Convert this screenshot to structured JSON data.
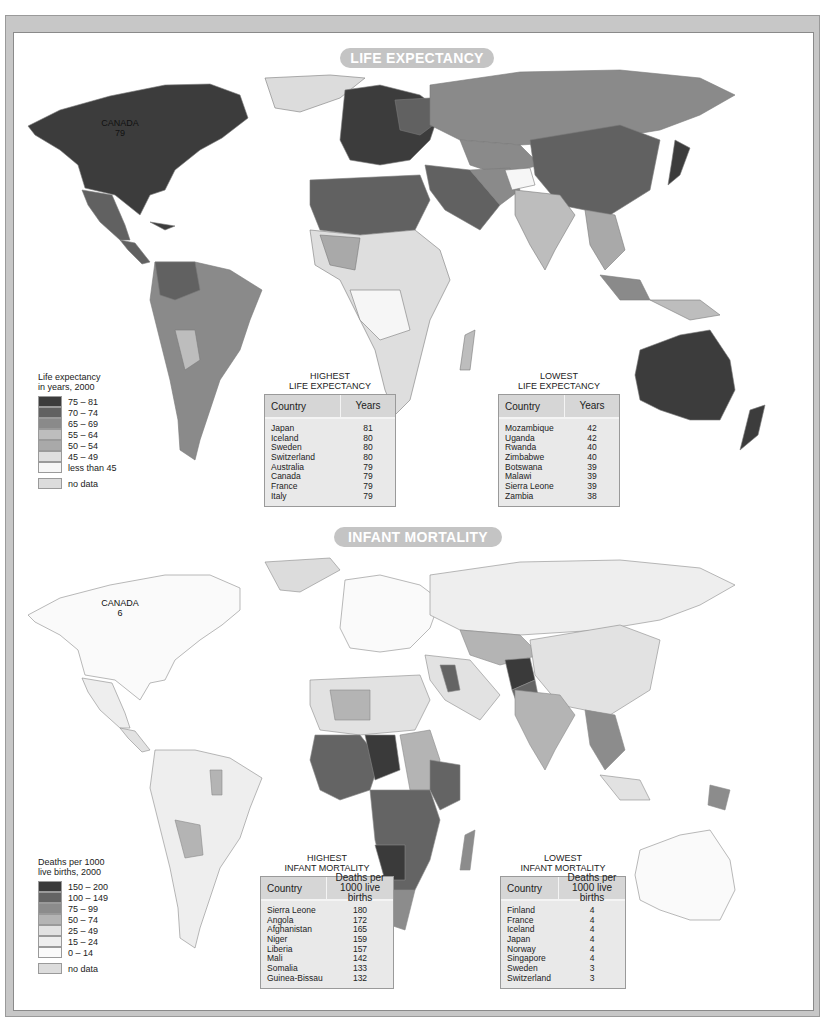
{
  "maps": [
    {
      "id": "life-expectancy",
      "title": "LIFE EXPECTANCY",
      "canada_label": {
        "name": "CANADA",
        "value": "79"
      },
      "legend": {
        "title_line1": "Life expectancy",
        "title_line2": "in years, 2000",
        "classes": [
          {
            "label": "75 – 81",
            "color": "#3c3c3c"
          },
          {
            "label": "70 – 74",
            "color": "#616161"
          },
          {
            "label": "65 – 69",
            "color": "#8a8a8a"
          },
          {
            "label": "55 – 64",
            "color": "#bdbdbd"
          },
          {
            "label": "50 – 54",
            "color": "#a9a9a9"
          },
          {
            "label": "45 – 49",
            "color": "#dedede"
          },
          {
            "label": "less than 45",
            "color": "#f6f6f6"
          }
        ],
        "no_data": {
          "label": "no data",
          "color": "#dcdcdc"
        }
      },
      "tables": [
        {
          "caption_line1": "HIGHEST",
          "caption_line2": "LIFE EXPECTANCY",
          "col1": "Country",
          "col2": "Years",
          "rows": [
            {
              "country": "Japan",
              "value": "81"
            },
            {
              "country": "Iceland",
              "value": "80"
            },
            {
              "country": "Sweden",
              "value": "80"
            },
            {
              "country": "Switzerland",
              "value": "80"
            },
            {
              "country": "Australia",
              "value": "79"
            },
            {
              "country": "Canada",
              "value": "79"
            },
            {
              "country": "France",
              "value": "79"
            },
            {
              "country": "Italy",
              "value": "79"
            }
          ]
        },
        {
          "caption_line1": "LOWEST",
          "caption_line2": "LIFE EXPECTANCY",
          "col1": "Country",
          "col2": "Years",
          "rows": [
            {
              "country": "Mozambique",
              "value": "42"
            },
            {
              "country": "Uganda",
              "value": "42"
            },
            {
              "country": "Rwanda",
              "value": "40"
            },
            {
              "country": "Zimbabwe",
              "value": "40"
            },
            {
              "country": "Botswana",
              "value": "39"
            },
            {
              "country": "Malawi",
              "value": "39"
            },
            {
              "country": "Sierra Leone",
              "value": "39"
            },
            {
              "country": "Zambia",
              "value": "38"
            }
          ]
        }
      ]
    },
    {
      "id": "infant-mortality",
      "title": "INFANT MORTALITY",
      "canada_label": {
        "name": "CANADA",
        "value": "6"
      },
      "legend": {
        "title_line1": "Deaths per 1000",
        "title_line2": "live births, 2000",
        "classes": [
          {
            "label": "150 – 200",
            "color": "#3a3a3a"
          },
          {
            "label": "100 – 149",
            "color": "#646464"
          },
          {
            "label": "75 – 99",
            "color": "#8c8c8c"
          },
          {
            "label": "50 – 74",
            "color": "#b4b4b4"
          },
          {
            "label": "25 – 49",
            "color": "#e2e2e2"
          },
          {
            "label": "15 – 24",
            "color": "#eeeeee"
          },
          {
            "label": "0 – 14",
            "color": "#fafafa"
          }
        ],
        "no_data": {
          "label": "no data",
          "color": "#dcdcdc"
        }
      },
      "tables": [
        {
          "caption_line1": "HIGHEST",
          "caption_line2": "INFANT MORTALITY",
          "col1": "Country",
          "col2_line1": "Deaths per",
          "col2_line2": "1000 live births",
          "rows": [
            {
              "country": "Sierra Leone",
              "value": "180"
            },
            {
              "country": "Angola",
              "value": "172"
            },
            {
              "country": "Afghanistan",
              "value": "165"
            },
            {
              "country": "Niger",
              "value": "159"
            },
            {
              "country": "Liberia",
              "value": "157"
            },
            {
              "country": "Mali",
              "value": "142"
            },
            {
              "country": "Somalia",
              "value": "133"
            },
            {
              "country": "Guinea-Bissau",
              "value": "132"
            }
          ]
        },
        {
          "caption_line1": "LOWEST",
          "caption_line2": "INFANT MORTALITY",
          "col1": "Country",
          "col2_line1": "Deaths per",
          "col2_line2": "1000 live births",
          "rows": [
            {
              "country": "Finland",
              "value": "4"
            },
            {
              "country": "France",
              "value": "4"
            },
            {
              "country": "Iceland",
              "value": "4"
            },
            {
              "country": "Japan",
              "value": "4"
            },
            {
              "country": "Norway",
              "value": "4"
            },
            {
              "country": "Singapore",
              "value": "4"
            },
            {
              "country": "Sweden",
              "value": "3"
            },
            {
              "country": "Switzerland",
              "value": "3"
            }
          ]
        }
      ]
    }
  ]
}
